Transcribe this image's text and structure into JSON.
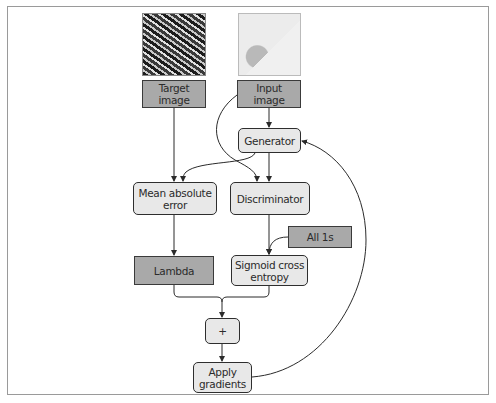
{
  "diagram": {
    "thumbnails": [
      {
        "id": "target",
        "description": "aerial photo of buildings"
      },
      {
        "id": "input",
        "description": "map-style rendering"
      }
    ],
    "nodes": [
      {
        "id": "target_image",
        "label_line1": "Target",
        "label_line2": "image",
        "style": "rect"
      },
      {
        "id": "input_image",
        "label_line1": "Input",
        "label_line2": "image",
        "style": "rect"
      },
      {
        "id": "generator",
        "label": "Generator",
        "style": "rounded"
      },
      {
        "id": "mae",
        "label_line1": "Mean absolute",
        "label_line2": "error",
        "style": "rounded"
      },
      {
        "id": "discriminator",
        "label": "Discriminator",
        "style": "rounded"
      },
      {
        "id": "all_ones",
        "label": "All 1s",
        "style": "rect"
      },
      {
        "id": "lambda",
        "label": "Lambda",
        "style": "rect"
      },
      {
        "id": "sigmoid",
        "label_line1": "Sigmoid cross",
        "label_line2": "entropy",
        "style": "rounded"
      },
      {
        "id": "plus",
        "label": "+",
        "style": "rounded"
      },
      {
        "id": "apply",
        "label_line1": "Apply",
        "label_line2": "gradients",
        "style": "rounded"
      }
    ],
    "edges": [
      [
        "target_image",
        "mae"
      ],
      [
        "input_image",
        "generator"
      ],
      [
        "input_image",
        "discriminator"
      ],
      [
        "generator",
        "mae"
      ],
      [
        "generator",
        "discriminator"
      ],
      [
        "mae",
        "lambda"
      ],
      [
        "discriminator",
        "sigmoid"
      ],
      [
        "all_ones",
        "sigmoid"
      ],
      [
        "lambda",
        "plus"
      ],
      [
        "sigmoid",
        "plus"
      ],
      [
        "plus",
        "apply"
      ],
      [
        "apply",
        "generator"
      ]
    ]
  }
}
